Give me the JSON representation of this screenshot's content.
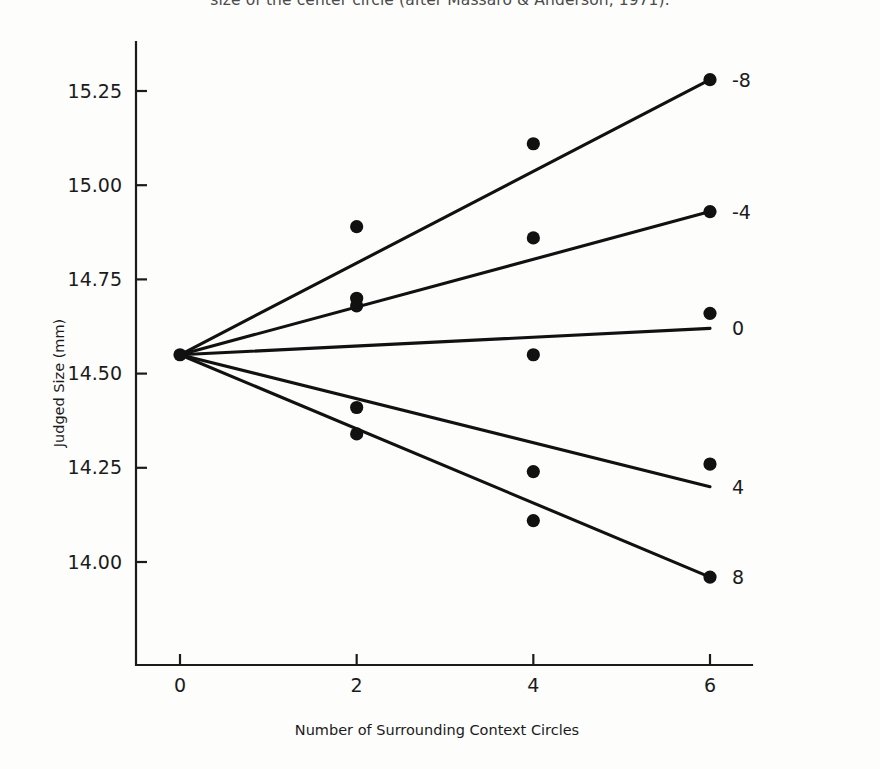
{
  "caption": "size of the center circle (after Massaro & Anderson, 1971).",
  "chart_data": {
    "type": "line",
    "title": "",
    "xlabel": "Number of Surrounding Context Circles",
    "ylabel": "Judged Size (mm)",
    "xlim": [
      -0.35,
      6.9
    ],
    "ylim": [
      13.82,
      15.42
    ],
    "xticks": [
      0,
      2,
      4,
      6
    ],
    "xtick_labels": [
      "0",
      "2",
      "4",
      "6"
    ],
    "yticks": [
      14.0,
      14.25,
      14.5,
      14.75,
      15.0,
      15.25
    ],
    "ytick_labels": [
      "14.00",
      "14.25",
      "14.50",
      "14.75",
      "15.00",
      "15.25"
    ],
    "grid": false,
    "legend": "right-of-line-ends",
    "legend_title": "",
    "x": [
      0,
      2,
      4,
      6
    ],
    "series": [
      {
        "name": "-8",
        "label": "-8",
        "values": [
          14.55,
          14.89,
          15.11,
          15.28
        ],
        "fit_endpoints": [
          14.55,
          15.28
        ]
      },
      {
        "name": "-4",
        "label": "-4",
        "values": [
          14.55,
          14.7,
          14.86,
          14.93
        ],
        "fit_endpoints": [
          14.55,
          14.93
        ]
      },
      {
        "name": "0",
        "label": "0",
        "values": [
          14.55,
          14.68,
          14.55,
          14.66
        ],
        "fit_endpoints": [
          14.55,
          14.62
        ]
      },
      {
        "name": "4",
        "label": "4",
        "values": [
          14.55,
          14.41,
          14.24,
          14.26
        ],
        "fit_endpoints": [
          14.55,
          14.2
        ]
      },
      {
        "name": "8",
        "label": "8",
        "values": [
          14.55,
          14.34,
          14.11,
          13.96
        ],
        "fit_endpoints": [
          14.55,
          13.96
        ]
      }
    ],
    "scatter_points": [
      {
        "series": "-8",
        "x": 2,
        "y": 14.89
      },
      {
        "series": "-8",
        "x": 4,
        "y": 15.11
      },
      {
        "series": "-8",
        "x": 6,
        "y": 15.28
      },
      {
        "series": "-4",
        "x": 2,
        "y": 14.7
      },
      {
        "series": "-4",
        "x": 4,
        "y": 14.86
      },
      {
        "series": "-4",
        "x": 6,
        "y": 14.93
      },
      {
        "series": "0",
        "x": 2,
        "y": 14.68
      },
      {
        "series": "0",
        "x": 4,
        "y": 14.55
      },
      {
        "series": "0",
        "x": 6,
        "y": 14.66
      },
      {
        "series": "4",
        "x": 2,
        "y": 14.41
      },
      {
        "series": "4",
        "x": 4,
        "y": 14.24
      },
      {
        "series": "4",
        "x": 6,
        "y": 14.26
      },
      {
        "series": "8",
        "x": 2,
        "y": 14.34
      },
      {
        "series": "8",
        "x": 4,
        "y": 14.11
      },
      {
        "series": "8",
        "x": 6,
        "y": 13.96
      },
      {
        "series": "origin",
        "x": 0,
        "y": 14.55
      }
    ]
  }
}
